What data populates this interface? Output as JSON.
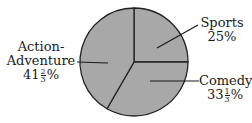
{
  "chart_data": {
    "type": "pie",
    "title": "",
    "categories": [
      "Sports",
      "Comedy",
      "Action-Adventure"
    ],
    "values": [
      25,
      33.333,
      41.667
    ],
    "value_labels": [
      "25%",
      "33 1/3%",
      "41 2/3%"
    ],
    "legend": "none (labels with leader lines)",
    "colors": {
      "fill": "#a8a8a8",
      "stroke": "#222222"
    }
  },
  "labels": {
    "sports": {
      "name": "Sports",
      "pct": "25%"
    },
    "comedy": {
      "name": "Comedy",
      "pct_whole": "33",
      "pct_num": "1",
      "pct_den": "3",
      "pct_sign": "%"
    },
    "action": {
      "name_line1": "Action-",
      "name_line2": "Adventure",
      "pct_whole": "41",
      "pct_num": "2",
      "pct_den": "3",
      "pct_sign": "%"
    }
  }
}
